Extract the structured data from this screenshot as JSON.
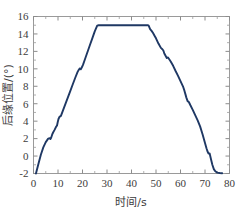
{
  "chart_data": {
    "type": "line",
    "title": "",
    "xlabel": "时间/s",
    "ylabel": "后缘位置/(°)",
    "xlim": [
      0,
      80
    ],
    "ylim": [
      -2,
      16
    ],
    "xticks": [
      0,
      10,
      20,
      30,
      40,
      50,
      60,
      70,
      80
    ],
    "yticks": [
      -2,
      0,
      2,
      4,
      6,
      8,
      10,
      12,
      14,
      16
    ],
    "xtick_labels": [
      "0",
      "10",
      "20",
      "30",
      "40",
      "50",
      "60",
      "70",
      "80"
    ],
    "ytick_labels": [
      "-2",
      "0",
      "2",
      "4",
      "6",
      "8",
      "10",
      "12",
      "14",
      "16"
    ],
    "grid": false,
    "legend": null,
    "series": [
      {
        "name": "后缘位置",
        "color": "#1f3864",
        "linewidth": 1.9,
        "x": [
          1.0,
          2.0,
          3.0,
          4.0,
          5.0,
          6.0,
          6.6,
          6.9,
          7.2,
          7.6,
          8.0,
          8.6,
          9.2,
          9.6,
          9.9,
          10.2,
          10.6,
          11.2,
          12.0,
          13.0,
          14.0,
          15.0,
          16.0,
          17.0,
          18.0,
          18.5,
          18.9,
          19.3,
          19.7,
          20.2,
          21.0,
          22.0,
          23.0,
          24.0,
          25.0,
          26.0,
          26.6,
          27.0,
          30.0,
          34.0,
          38.0,
          42.0,
          45.0,
          46.6,
          47.0,
          47.6,
          48.2,
          48.8,
          49.4,
          50.0,
          51.0,
          52.0,
          52.6,
          53.0,
          53.4,
          53.9,
          54.4,
          54.9,
          55.4,
          56.0,
          57.0,
          58.0,
          59.0,
          60.0,
          61.0,
          61.6,
          62.0,
          62.4,
          62.9,
          63.4,
          64.0,
          65.0,
          66.0,
          67.0,
          68.0,
          69.0,
          70.0,
          70.6,
          71.0,
          71.4,
          71.9,
          72.4,
          73.0,
          73.6,
          74.2,
          75.0,
          76.0,
          77.0
        ],
        "y": [
          -2.0,
          -0.9,
          0.15,
          1.0,
          1.6,
          2.0,
          2.05,
          1.95,
          2.1,
          2.45,
          2.7,
          3.0,
          3.35,
          3.5,
          3.9,
          4.25,
          4.5,
          4.6,
          5.2,
          5.95,
          6.7,
          7.45,
          8.2,
          8.95,
          9.65,
          9.9,
          10.05,
          9.95,
          10.15,
          10.45,
          11.1,
          11.9,
          12.7,
          13.5,
          14.3,
          14.95,
          15.0,
          15.0,
          15.0,
          15.0,
          15.0,
          15.0,
          15.0,
          15.0,
          14.95,
          14.55,
          14.35,
          14.1,
          13.8,
          13.5,
          12.9,
          12.4,
          12.25,
          12.1,
          11.75,
          11.5,
          11.25,
          11.3,
          11.1,
          10.85,
          10.35,
          9.75,
          9.2,
          8.6,
          8.0,
          7.5,
          7.1,
          6.7,
          6.3,
          6.2,
          5.85,
          5.3,
          4.7,
          4.1,
          3.4,
          2.5,
          1.5,
          0.9,
          0.55,
          0.3,
          0.3,
          -0.3,
          -1.0,
          -1.5,
          -1.75,
          -1.9,
          -1.95,
          -1.97
        ]
      }
    ]
  },
  "axes": {
    "y_axis_label": "后缘位置/(°)",
    "x_axis_label": "时间/s",
    "frame_color": "#9a9a9a"
  }
}
